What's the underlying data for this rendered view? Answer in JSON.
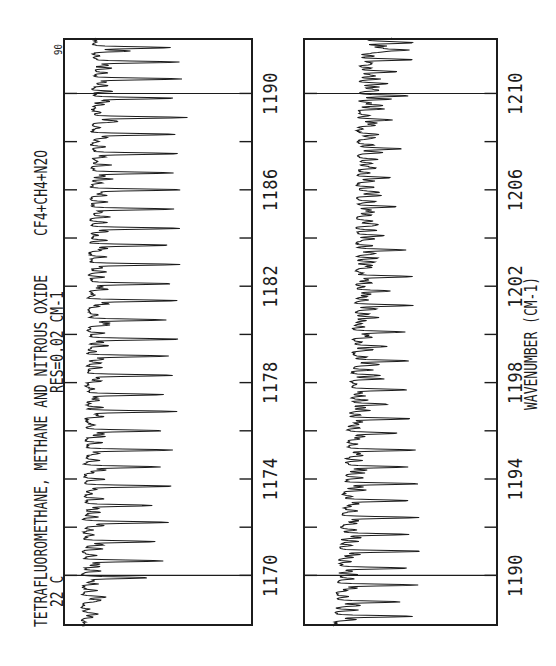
{
  "page": {
    "background": "#ffffff",
    "ink": "#1c1c1c"
  },
  "header": {
    "title": "TETRAFLUOROMETHANE, METHANE AND NITROUS OXIDE",
    "mixture_label": "CF4+CH4+N2O",
    "temperature": "22 C",
    "resolution": "RES=0.02 CM-1",
    "baseline_marker": "90"
  },
  "axis": {
    "title": "WAVENUMBER (CM-1)"
  },
  "chart_data": {
    "type": "line",
    "title": "TETRAFLUOROMETHANE, METHANE AND NITROUS OXIDE",
    "subtitle": "22 C   RES=0.02 CM-1   CF4+CH4+N2O",
    "xlabel": "WAVENUMBER (CM-1)",
    "ylabel": "TRANSMITTANCE (baseline near 90%)",
    "orientation_note": "landscape chart printed rotated 90deg counter-clockwise on portrait page",
    "grid": "major gridlines only at decade wavenumbers; inward ticks every 2 cm-1 on top and bottom edges",
    "legend": "none",
    "noise_seed": 7,
    "panels": [
      {
        "name": "upper band 1168-1192 cm-1",
        "x_min": 1167.9,
        "x_max": 1192.3,
        "tick_step": 2,
        "label_step": 4,
        "tick_labels": [
          "1170",
          "1174",
          "1178",
          "1182",
          "1186",
          "1190"
        ],
        "gridlines": [
          1170,
          1190
        ],
        "baseline": {
          "left": 0.105,
          "right": 0.17,
          "bump": 0.0
        },
        "lines": [
          [
            1168.4,
            0.08
          ],
          [
            1169.1,
            0.13
          ],
          [
            1169.9,
            0.34
          ],
          [
            1170.6,
            0.42
          ],
          [
            1171.4,
            0.38
          ],
          [
            1172.2,
            0.45
          ],
          [
            1172.9,
            0.36
          ],
          [
            1173.7,
            0.47
          ],
          [
            1174.5,
            0.39
          ],
          [
            1175.2,
            0.46
          ],
          [
            1176.0,
            0.41
          ],
          [
            1176.8,
            0.48
          ],
          [
            1177.5,
            0.4
          ],
          [
            1178.3,
            0.46
          ],
          [
            1179.1,
            0.42
          ],
          [
            1179.8,
            0.48
          ],
          [
            1180.6,
            0.41
          ],
          [
            1181.4,
            0.47
          ],
          [
            1182.1,
            0.43
          ],
          [
            1182.9,
            0.48
          ],
          [
            1183.7,
            0.42
          ],
          [
            1184.4,
            0.47
          ],
          [
            1185.2,
            0.44
          ],
          [
            1186.0,
            0.48
          ],
          [
            1186.7,
            0.42
          ],
          [
            1187.5,
            0.46
          ],
          [
            1188.3,
            0.44
          ],
          [
            1189.0,
            0.49
          ],
          [
            1189.8,
            0.43
          ],
          [
            1190.6,
            0.47
          ],
          [
            1191.3,
            0.44
          ],
          [
            1191.9,
            0.4
          ]
        ]
      },
      {
        "name": "lower band 1188-1212 cm-1",
        "x_min": 1187.9,
        "x_max": 1212.3,
        "tick_step": 2,
        "label_step": 4,
        "tick_labels": [
          "1190",
          "1194",
          "1198",
          "1202",
          "1206",
          "1210"
        ],
        "gridlines": [
          1190,
          1210
        ],
        "baseline": {
          "left": 0.165,
          "right": 0.29,
          "bump": 0.035
        },
        "lines": [
          [
            1188.3,
            0.4
          ],
          [
            1188.9,
            0.33
          ],
          [
            1189.6,
            0.41
          ],
          [
            1190.3,
            0.35
          ],
          [
            1191.0,
            0.42
          ],
          [
            1191.7,
            0.34
          ],
          [
            1192.4,
            0.4
          ],
          [
            1193.1,
            0.33
          ],
          [
            1193.8,
            0.38
          ],
          [
            1194.5,
            0.3
          ],
          [
            1195.2,
            0.36
          ],
          [
            1195.9,
            0.25
          ],
          [
            1196.5,
            0.32
          ],
          [
            1197.1,
            0.2
          ],
          [
            1197.7,
            0.28
          ],
          [
            1198.3,
            0.14
          ],
          [
            1198.9,
            0.3
          ],
          [
            1199.5,
            0.16
          ],
          [
            1200.1,
            0.26
          ],
          [
            1200.7,
            0.12
          ],
          [
            1201.2,
            0.3
          ],
          [
            1201.8,
            0.17
          ],
          [
            1202.4,
            0.3
          ],
          [
            1203.0,
            0.1
          ],
          [
            1203.5,
            0.26
          ],
          [
            1204.1,
            0.13
          ],
          [
            1204.7,
            0.08
          ],
          [
            1205.3,
            0.2
          ],
          [
            1205.9,
            0.11
          ],
          [
            1206.5,
            0.16
          ],
          [
            1207.1,
            0.08
          ],
          [
            1207.7,
            0.22
          ],
          [
            1208.3,
            0.1
          ],
          [
            1208.9,
            0.18
          ],
          [
            1209.5,
            0.12
          ],
          [
            1209.9,
            0.26
          ],
          [
            1210.4,
            0.15
          ],
          [
            1210.9,
            0.2
          ],
          [
            1211.4,
            0.27
          ],
          [
            1211.8,
            0.25
          ],
          [
            1212.1,
            0.28
          ],
          [
            1212.4,
            0.27
          ],
          [
            1212.7,
            0.26
          ]
        ]
      }
    ]
  }
}
